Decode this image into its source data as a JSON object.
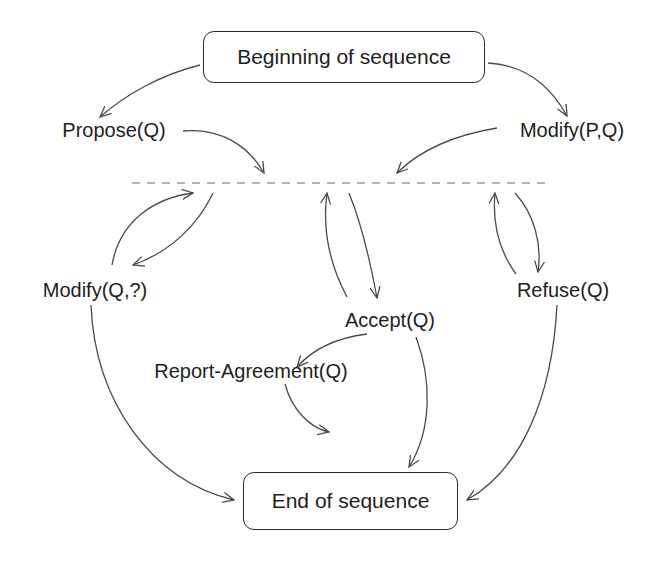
{
  "diagram": {
    "type": "state-transition",
    "start_node": {
      "id": "begin",
      "label": "Beginning of sequence"
    },
    "end_node": {
      "id": "end",
      "label": "End of sequence"
    },
    "divider": {
      "style": "dashed",
      "meaning": "central dialogue state"
    },
    "nodes": [
      {
        "id": "propose",
        "label": "Propose(Q)"
      },
      {
        "id": "modify_pq",
        "label": "Modify(P,Q)"
      },
      {
        "id": "modify_q",
        "label": "Modify(Q,?)"
      },
      {
        "id": "accept",
        "label": "Accept(Q)"
      },
      {
        "id": "refuse",
        "label": "Refuse(Q)"
      },
      {
        "id": "report",
        "label": "Report-Agreement(Q)"
      }
    ],
    "edges": [
      {
        "from": "begin",
        "to": "propose"
      },
      {
        "from": "begin",
        "to": "modify_pq"
      },
      {
        "from": "propose",
        "to": "divider"
      },
      {
        "from": "modify_pq",
        "to": "divider"
      },
      {
        "from": "modify_q",
        "to": "divider"
      },
      {
        "from": "divider",
        "to": "modify_q"
      },
      {
        "from": "accept",
        "to": "divider"
      },
      {
        "from": "divider",
        "to": "accept"
      },
      {
        "from": "refuse",
        "to": "divider"
      },
      {
        "from": "divider",
        "to": "refuse"
      },
      {
        "from": "accept",
        "to": "report"
      },
      {
        "from": "accept",
        "to": "end"
      },
      {
        "from": "report",
        "to": "end"
      },
      {
        "from": "modify_q",
        "to": "end"
      },
      {
        "from": "refuse",
        "to": "end"
      }
    ]
  },
  "labels": {
    "begin": "Beginning of sequence",
    "end": "End of sequence",
    "propose": "Propose(Q)",
    "modify_pq": "Modify(P,Q)",
    "modify_q": "Modify(Q,?)",
    "accept": "Accept(Q)",
    "refuse": "Refuse(Q)",
    "report": "Report-Agreement(Q)"
  },
  "colors": {
    "line": "#4a4a4a",
    "text": "#1e1e1e",
    "background": "#ffffff"
  }
}
